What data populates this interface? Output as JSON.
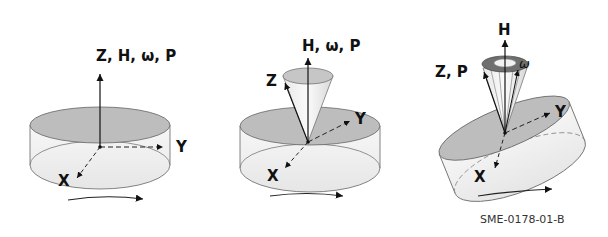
{
  "panels": [
    {
      "id": "panel-1",
      "axis_label_up": "Z, H, ω, P",
      "axis_label_y": "Y",
      "axis_label_x": "X"
    },
    {
      "id": "panel-2",
      "axis_label_up": "H, ω, P",
      "axis_label_z": "Z",
      "axis_label_y": "Y",
      "axis_label_x": "X"
    },
    {
      "id": "panel-3",
      "axis_label_up": "H",
      "axis_label_z": "Z, P",
      "axis_label_omega": "ω",
      "axis_label_y": "Y",
      "axis_label_x": "X"
    }
  ],
  "caption": "SME-0178-01-B",
  "colors": {
    "disk_top": "#bdbdbd",
    "disk_side": "#f2f2f2",
    "outline": "#555555",
    "ink": "#111111"
  }
}
